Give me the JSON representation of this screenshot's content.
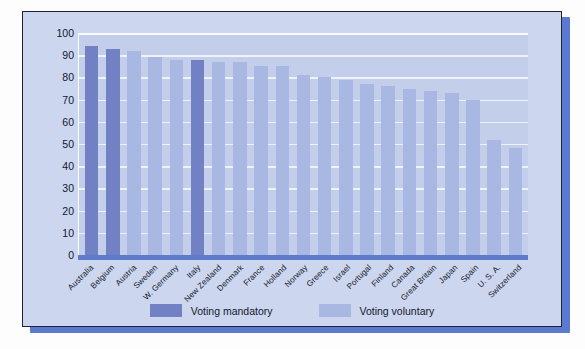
{
  "chart_data": {
    "type": "bar",
    "title": "",
    "xlabel": "",
    "ylabel": "Percentage",
    "ylim": [
      0,
      100
    ],
    "yticks": [
      100,
      90,
      80,
      70,
      60,
      50,
      40,
      30,
      20,
      10,
      0
    ],
    "grid": true,
    "legend_position": "bottom-center",
    "categories": [
      "Australia",
      "Belgium",
      "Austria",
      "Sweden",
      "W. Germany",
      "Italy",
      "New Zealand",
      "Denmark",
      "France",
      "Holland",
      "Norway",
      "Greece",
      "Israel",
      "Portugal",
      "Finland",
      "Canada",
      "Great Britain",
      "Japan",
      "Spain",
      "U. S. A.",
      "Switzerland"
    ],
    "values": [
      94,
      93,
      92,
      89,
      88,
      88,
      87,
      87,
      85,
      85,
      81,
      80,
      79,
      77,
      76,
      75,
      74,
      73,
      70,
      52,
      48
    ],
    "groups": [
      "mandatory",
      "mandatory",
      "voluntary",
      "voluntary",
      "voluntary",
      "mandatory",
      "voluntary",
      "voluntary",
      "voluntary",
      "voluntary",
      "voluntary",
      "voluntary",
      "voluntary",
      "voluntary",
      "voluntary",
      "voluntary",
      "voluntary",
      "voluntary",
      "voluntary",
      "voluntary",
      "voluntary"
    ],
    "legend": [
      {
        "key": "mandatory",
        "label": "Voting mandatory",
        "color": "#7181c4"
      },
      {
        "key": "voluntary",
        "label": "Voting voluntary",
        "color": "#a9b8e2"
      }
    ]
  },
  "colors": {
    "figure_background": "#ccd6ef",
    "plot_background": "#c3cfea",
    "gridline": "#f2f5fc",
    "frame_border": "#1d2438",
    "drop_shadow": "#5b79cf",
    "baseline": "#5f7ac9",
    "text": "#13182a",
    "mandatory": "#7181c4",
    "voluntary": "#a9b8e2"
  }
}
